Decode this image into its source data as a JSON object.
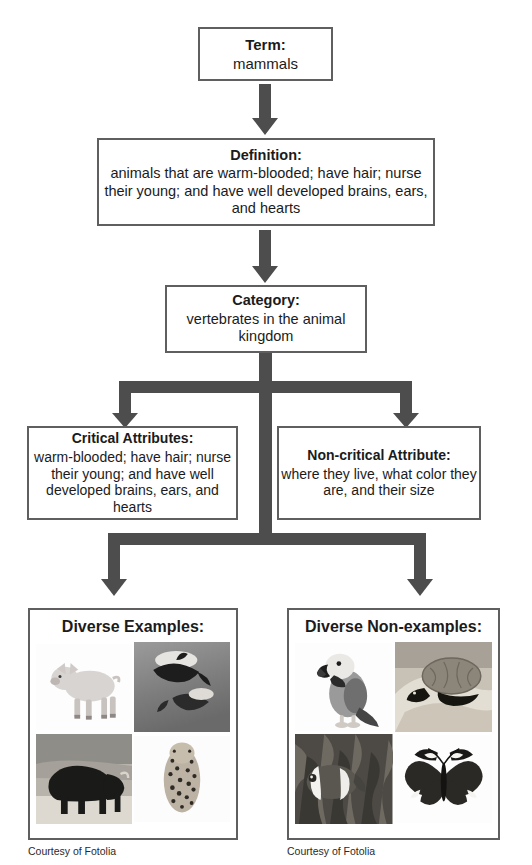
{
  "diagram": {
    "kind": "frayer-concept-map",
    "colors": {
      "box_border": "#5f5f5f",
      "arrow": "#4d4d4d",
      "text": "#1b1b1b",
      "background": "#ffffff"
    },
    "nodes": {
      "term": {
        "title": "Term:",
        "body": "mammals"
      },
      "definition": {
        "title": "Definition:",
        "body": "animals that are warm-blooded; have hair; nurse their young; and have well developed brains, ears, and hearts"
      },
      "category": {
        "title": "Category:",
        "body": "vertebrates in the animal kingdom"
      },
      "critical_attributes": {
        "title": "Critical Attributes:",
        "body": "warm-blooded; have hair; nurse their young; and have well developed brains, ears, and hearts"
      },
      "noncritical_attribute": {
        "title": "Non-critical Attribute:",
        "body": "where they live, what color they are, and their size"
      },
      "examples": {
        "title": "Diverse Examples:",
        "caption": "Courtesy of Fotolia",
        "photos": [
          {
            "name": "pig-photo",
            "label": "pig"
          },
          {
            "name": "dolphins-photo",
            "label": "dolphins"
          },
          {
            "name": "bison-photo",
            "label": "bison"
          },
          {
            "name": "cheetah-photo",
            "label": "cheetah"
          }
        ]
      },
      "nonexamples": {
        "title": "Diverse Non-examples:",
        "caption": "Courtesy of Fotolia",
        "photos": [
          {
            "name": "parrot-photo",
            "label": "parrot"
          },
          {
            "name": "turtle-photo",
            "label": "turtle"
          },
          {
            "name": "clownfish-photo",
            "label": "clownfish"
          },
          {
            "name": "butterfly-photo",
            "label": "butterfly"
          }
        ]
      }
    },
    "connectors": [
      {
        "name": "arrow-term-to-definition",
        "type": "down-arrow"
      },
      {
        "name": "arrow-definition-to-category",
        "type": "down-arrow"
      },
      {
        "name": "bracket-category-to-attributes",
        "type": "split-bracket"
      },
      {
        "name": "bracket-category-to-examples",
        "type": "split-bracket"
      }
    ]
  }
}
